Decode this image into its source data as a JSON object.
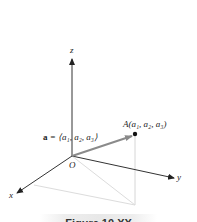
{
  "diagram": {
    "axes": {
      "x_label": "x",
      "y_label": "y",
      "z_label": "z",
      "origin_label": "O"
    },
    "point": {
      "name": "A",
      "label": "A(a₁, a₂, a₃)"
    },
    "vector": {
      "label_bold": "a",
      "label_rest": " = ⟨a₁, a₂, a₃⟩"
    },
    "caption": "Figure 10.XX",
    "colors": {
      "axis": "#333333",
      "vector": "#8a8a8a",
      "projection": "#d6d6d6",
      "point": "#111111"
    }
  }
}
